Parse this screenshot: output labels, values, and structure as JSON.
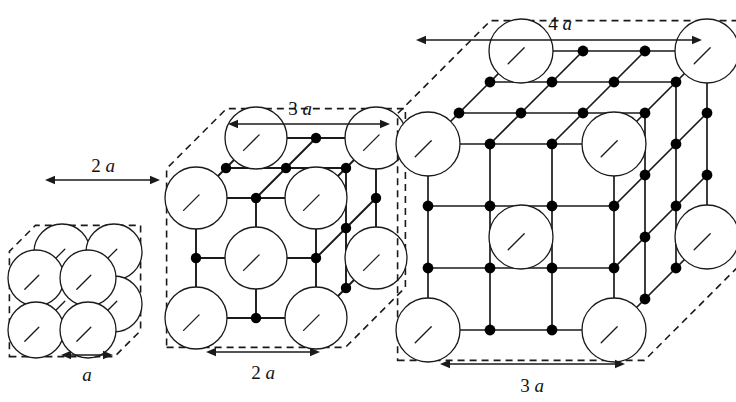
{
  "figure": {
    "background_color": "#ffffff",
    "line_color": "#1a1a1a",
    "node_color": "#000000",
    "sphere_fill": "#ffffff"
  },
  "panels": [
    {
      "id": "panel-1",
      "order": 1,
      "cells_per_edge": 1,
      "top_label": {
        "number": "2",
        "unit": "a",
        "text": "2 a"
      },
      "bottom_label": {
        "number": "",
        "unit": "a",
        "text": "a"
      },
      "origin_x": 36,
      "origin_y": 330,
      "cell": 52,
      "depth": 26,
      "sphere_r": 28,
      "node_r": 4.4,
      "bond_width": 2.0,
      "sphere_width": 1.3,
      "top_dim": {
        "x1": 45,
        "x2": 160,
        "y": 180,
        "label_x": 103,
        "label_y": 172
      },
      "bottom_dim": {
        "x1": 61,
        "x2": 113,
        "y": 355,
        "label_x": 87,
        "label_y": 381
      }
    },
    {
      "id": "panel-2",
      "order": 2,
      "cells_per_edge": 2,
      "top_label": {
        "number": "3",
        "unit": "a",
        "text": "3 a"
      },
      "bottom_label": {
        "number": "2",
        "unit": "a",
        "text": "2 a"
      },
      "origin_x": 196,
      "origin_y": 318,
      "cell": 60,
      "depth": 30,
      "sphere_r": 31,
      "node_r": 5.2,
      "bond_width": 1.9,
      "sphere_width": 1.3,
      "top_dim": {
        "x1": 228,
        "x2": 390,
        "y": 124,
        "label_x": 300,
        "label_y": 115
      },
      "bottom_dim": {
        "x1": 206,
        "x2": 320,
        "y": 352,
        "label_x": 263,
        "label_y": 379
      }
    },
    {
      "id": "panel-3",
      "order": 3,
      "cells_per_edge": 3,
      "top_label": {
        "number": "4",
        "unit": "a",
        "text": "4 a"
      },
      "bottom_label": {
        "number": "3",
        "unit": "a",
        "text": "3 a"
      },
      "origin_x": 428,
      "origin_y": 330,
      "cell": 62,
      "depth": 31,
      "sphere_r": 32,
      "node_r": 5.4,
      "bond_width": 1.7,
      "sphere_width": 1.3,
      "top_dim": {
        "x1": 416,
        "x2": 702,
        "y": 40,
        "label_x": 560,
        "label_y": 30
      },
      "bottom_dim": {
        "x1": 440,
        "x2": 625,
        "y": 364,
        "label_x": 532,
        "label_y": 392
      }
    }
  ]
}
